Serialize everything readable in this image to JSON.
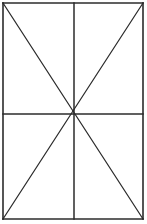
{
  "figure": {
    "name": "rectangle-with-medians-and-diagonals",
    "canvas": {
      "width": 147,
      "height": 224,
      "background_color": "#ffffff"
    },
    "style": {
      "line_color": "#2b2b2b",
      "outline_stroke_width": 1.6,
      "median_stroke_width": 1.5,
      "diagonal_stroke_width": 1.25
    },
    "rectangle": {
      "label": "outer rectangle",
      "left": 3,
      "top": 3,
      "right": 143,
      "bottom": 219,
      "width": 140,
      "height": 216
    },
    "center_point": {
      "label": "center intersection",
      "x": 74,
      "y": 114
    },
    "corners": [
      {
        "label": "top-left",
        "x": 3,
        "y": 3
      },
      {
        "label": "top-right",
        "x": 143,
        "y": 3
      },
      {
        "label": "bottom-right",
        "x": 143,
        "y": 219
      },
      {
        "label": "bottom-left",
        "x": 3,
        "y": 219
      }
    ],
    "outline_segments": [
      {
        "label": "top-edge",
        "x1": 3,
        "y1": 3,
        "x2": 143,
        "y2": 3
      },
      {
        "label": "right-edge",
        "x1": 143,
        "y1": 3,
        "x2": 143,
        "y2": 219
      },
      {
        "label": "bottom-edge",
        "x1": 143,
        "y1": 219,
        "x2": 3,
        "y2": 219
      },
      {
        "label": "left-edge",
        "x1": 3,
        "y1": 219,
        "x2": 3,
        "y2": 3
      }
    ],
    "median_segments": [
      {
        "label": "vertical-median",
        "x1": 74,
        "y1": 3,
        "x2": 74,
        "y2": 219
      },
      {
        "label": "horizontal-median",
        "x1": 3,
        "y1": 114,
        "x2": 143,
        "y2": 114
      }
    ],
    "diagonal_segments": [
      {
        "label": "diagonal-tl-br",
        "x1": 3,
        "y1": 3,
        "x2": 143,
        "y2": 219
      },
      {
        "label": "diagonal-tr-bl",
        "x1": 143,
        "y1": 3,
        "x2": 3,
        "y2": 219
      }
    ],
    "quadrant_count": 4,
    "triangle_count": 8
  }
}
